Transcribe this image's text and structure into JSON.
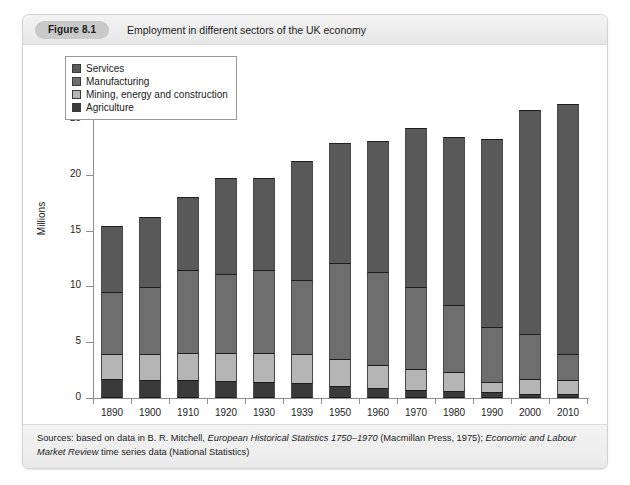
{
  "figure": {
    "badge": "Figure 8.1",
    "title": "Employment in different sectors of the UK economy",
    "source_prefix": "Sources: based on data in B. R. Mitchell, ",
    "source_italic_1": "European Historical Statistics 1750–1970",
    "source_mid": " (Macmillan Press, 1975); ",
    "source_italic_2": "Economic and Labour Market Review",
    "source_suffix": " time series data (National Statistics)"
  },
  "colors": {
    "services": "#595959",
    "manufacturing": "#6e6e6e",
    "mining": "#b5b5b5",
    "agriculture": "#3a3a3a",
    "axis": "#8d8d8d",
    "card_border": "#d2d2d2",
    "header_bg": "#ededed",
    "badge_bg": "#c9c9c9"
  },
  "chart_data": {
    "type": "bar",
    "subtype": "stacked-column",
    "title": "Employment in different sectors of the UK economy",
    "xlabel": "",
    "ylabel": "Millions",
    "ylim": [
      0,
      30
    ],
    "yticks": [
      0,
      5,
      10,
      15,
      20,
      25,
      30
    ],
    "grid": false,
    "legend_position": "top-left",
    "categories": [
      "1890",
      "1900",
      "1910",
      "1920",
      "1930",
      "1939",
      "1950",
      "1960",
      "1970",
      "1980",
      "1990",
      "2000",
      "2010"
    ],
    "series": [
      {
        "name": "Agriculture",
        "values": [
          1.7,
          1.6,
          1.6,
          1.5,
          1.4,
          1.3,
          1.1,
          0.9,
          0.7,
          0.6,
          0.5,
          0.4,
          0.4
        ]
      },
      {
        "name": "Mining, energy and construction",
        "values": [
          2.2,
          2.3,
          2.4,
          2.5,
          2.6,
          2.6,
          2.4,
          2.1,
          1.9,
          1.7,
          0.9,
          1.3,
          1.2
        ]
      },
      {
        "name": "Manufacturing",
        "values": [
          5.6,
          6.0,
          7.5,
          7.1,
          7.5,
          6.7,
          8.6,
          8.3,
          7.3,
          6.0,
          5.0,
          4.0,
          2.3
        ]
      },
      {
        "name": "Services",
        "values": [
          5.9,
          6.3,
          6.5,
          8.6,
          8.2,
          10.6,
          10.7,
          11.7,
          14.3,
          15.1,
          16.8,
          20.1,
          22.4
        ]
      }
    ],
    "totals": [
      15.4,
      16.2,
      18.0,
      19.7,
      21.5,
      21.2,
      22.8,
      23.0,
      24.2,
      23.4,
      23.2,
      25.8,
      26.3
    ],
    "stack_order_bottom_to_top": [
      "Agriculture",
      "Mining, energy and construction",
      "Manufacturing",
      "Services"
    ]
  },
  "legend": {
    "items": [
      {
        "label": "Services",
        "color": "#595959"
      },
      {
        "label": "Manufacturing",
        "color": "#6e6e6e"
      },
      {
        "label": "Mining, energy and construction",
        "color": "#b5b5b5"
      },
      {
        "label": "Agriculture",
        "color": "#3a3a3a"
      }
    ]
  }
}
